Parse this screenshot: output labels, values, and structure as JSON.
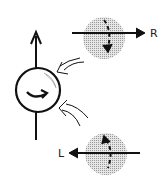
{
  "diagram": {
    "labels": {
      "right": "R",
      "left": "L"
    },
    "colors": {
      "stroke": "#111111",
      "disk": "#bdbdbd",
      "background": "#ffffff"
    },
    "elements": [
      {
        "name": "spinning-ball",
        "type": "circle-with-curved-arrow"
      },
      {
        "name": "vertical-axis-arrow",
        "type": "arrow-up"
      },
      {
        "name": "incoming-flow-upper",
        "type": "outline-arrow"
      },
      {
        "name": "incoming-flow-lower",
        "type": "outline-arrow"
      },
      {
        "name": "disk-right",
        "type": "shaded-disk",
        "arrow": "right",
        "label": "R"
      },
      {
        "name": "disk-left",
        "type": "shaded-disk",
        "arrow": "left",
        "label": "L"
      }
    ]
  }
}
